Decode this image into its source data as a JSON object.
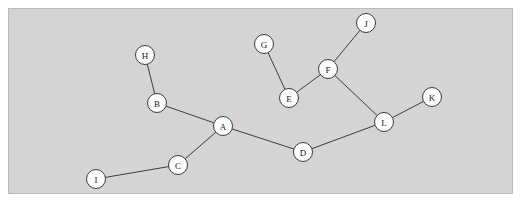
{
  "figure": {
    "type": "node-link-graph",
    "background_color": "#d4d4d4",
    "page_color": "#ffffff",
    "border_color": "#b9b9b9",
    "node_fill": "#fdfdfd",
    "node_stroke": "#3a3a3a",
    "edge_color": "#3c3c3c",
    "node_radius": 9.5,
    "panel": {
      "x": 8,
      "y": 8,
      "width": 505,
      "height": 186
    }
  },
  "graph": {
    "node_count": 12,
    "edge_count": 11,
    "nodes": [
      {
        "id": "A",
        "label": "A",
        "x": 223,
        "y": 126
      },
      {
        "id": "B",
        "label": "B",
        "x": 157,
        "y": 103
      },
      {
        "id": "C",
        "label": "C",
        "x": 178,
        "y": 165
      },
      {
        "id": "D",
        "label": "D",
        "x": 303,
        "y": 152
      },
      {
        "id": "E",
        "label": "E",
        "x": 289,
        "y": 98
      },
      {
        "id": "F",
        "label": "F",
        "x": 328,
        "y": 69
      },
      {
        "id": "G",
        "label": "G",
        "x": 264,
        "y": 44
      },
      {
        "id": "H",
        "label": "H",
        "x": 145,
        "y": 55
      },
      {
        "id": "I",
        "label": "I",
        "x": 96,
        "y": 179
      },
      {
        "id": "J",
        "label": "J",
        "x": 366,
        "y": 23
      },
      {
        "id": "K",
        "label": "K",
        "x": 432,
        "y": 97
      },
      {
        "id": "L",
        "label": "L",
        "x": 384,
        "y": 122
      }
    ],
    "edges": [
      {
        "source": "H",
        "target": "B"
      },
      {
        "source": "B",
        "target": "A"
      },
      {
        "source": "A",
        "target": "C"
      },
      {
        "source": "C",
        "target": "I"
      },
      {
        "source": "A",
        "target": "D"
      },
      {
        "source": "D",
        "target": "L"
      },
      {
        "source": "L",
        "target": "K"
      },
      {
        "source": "L",
        "target": "F"
      },
      {
        "source": "F",
        "target": "J"
      },
      {
        "source": "F",
        "target": "E"
      },
      {
        "source": "E",
        "target": "G"
      }
    ]
  }
}
